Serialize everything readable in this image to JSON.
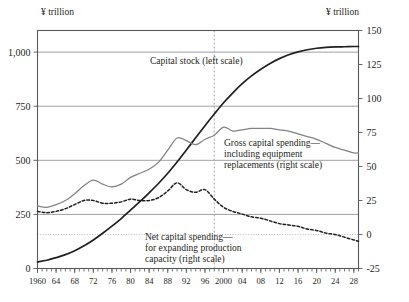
{
  "figure": {
    "left_unit_label": "¥ trillion",
    "right_unit_label": "¥ trillion"
  },
  "annotations": {
    "capital_stock": "Capital stock (left scale)",
    "gross_line1": "Gross capital spending—",
    "gross_line2": "including equipment",
    "gross_line3": "replacements (right scale)",
    "net_line1": "Net capital spending—",
    "net_line2": "for expanding production",
    "net_line3": "capacity (right scale)"
  },
  "colors": {
    "capital_stock": "#231f20",
    "gross_spending": "#808285",
    "net_spending": "#231f20",
    "grid": "#939598",
    "frame": "#58595b",
    "marker_line": "#a7a9ac"
  },
  "chart_data": {
    "type": "line",
    "title": "",
    "xlabel": "",
    "ylabel": "¥ trillion",
    "y2label": "¥ trillion",
    "grid": true,
    "legend": "inline-annotations",
    "xlim": [
      1960,
      2029
    ],
    "ylim": [
      0,
      1100
    ],
    "y2lim": [
      -25,
      150
    ],
    "left_ticks": [
      0,
      250,
      500,
      750,
      1000
    ],
    "left_tick_labels": [
      "0",
      "250",
      "500",
      "750",
      "1,000"
    ],
    "right_ticks": [
      -25,
      0,
      25,
      50,
      75,
      100,
      125,
      150
    ],
    "right_tick_labels": [
      "-25",
      "0",
      "25",
      "50",
      "75",
      "100",
      "125",
      "150"
    ],
    "x_ticks": [
      1960,
      1964,
      1968,
      1972,
      1976,
      1980,
      1984,
      1988,
      1992,
      1996,
      2000,
      2004,
      2008,
      2012,
      2016,
      2020,
      2024,
      2028
    ],
    "x_tick_labels": [
      "1960",
      "64",
      "68",
      "72",
      "76",
      "80",
      "84",
      "88",
      "92",
      "96",
      "2000",
      "04",
      "08",
      "12",
      "16",
      "20",
      "24",
      "28"
    ],
    "forecast_marker_x": 1998,
    "x": [
      1960,
      1962,
      1964,
      1966,
      1968,
      1970,
      1972,
      1974,
      1976,
      1978,
      1980,
      1982,
      1984,
      1986,
      1988,
      1990,
      1992,
      1994,
      1996,
      1998,
      2000,
      2002,
      2004,
      2006,
      2008,
      2010,
      2012,
      2014,
      2016,
      2018,
      2020,
      2022,
      2024,
      2026,
      2028,
      2029
    ],
    "series": [
      {
        "name": "Capital stock (left scale)",
        "axis": "left",
        "style": "solid-black",
        "values": [
          30,
          38,
          50,
          64,
          82,
          105,
          132,
          163,
          196,
          231,
          270,
          309,
          350,
          393,
          440,
          492,
          548,
          604,
          660,
          714,
          766,
          812,
          854,
          890,
          921,
          948,
          970,
          988,
          1001,
          1011,
          1018,
          1022,
          1024,
          1025,
          1026,
          1026
        ]
      },
      {
        "name": "Gross capital spending—including equipment replacements (right scale)",
        "axis": "right",
        "style": "solid-gray",
        "values": [
          21,
          20,
          22,
          25,
          30,
          36,
          40,
          37,
          35,
          37,
          42,
          45,
          48,
          53,
          62,
          71,
          69,
          66,
          70,
          73,
          79,
          76,
          77,
          78,
          78,
          78,
          77,
          76,
          74,
          72,
          70,
          67,
          64,
          62,
          60,
          60
        ]
      },
      {
        "name": "Net capital spending—for expanding production capacity (right scale)",
        "axis": "right",
        "style": "dashed-black",
        "values": [
          17,
          16,
          17,
          19,
          22,
          25,
          25,
          23,
          23,
          24,
          26,
          25,
          25,
          27,
          32,
          38,
          33,
          31,
          33,
          26,
          20,
          17,
          15,
          13,
          12,
          10,
          8,
          7,
          6,
          4,
          3,
          1,
          0,
          -2,
          -4,
          -5
        ]
      }
    ]
  }
}
